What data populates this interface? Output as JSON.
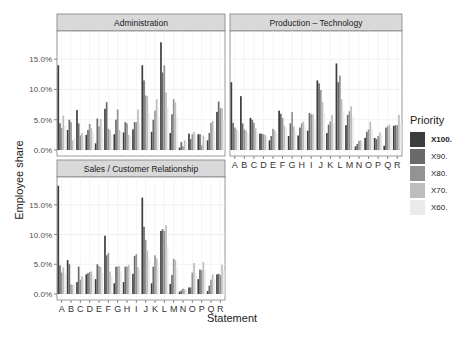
{
  "chart_data": {
    "type": "bar",
    "subtype": "grouped-faceted",
    "ylabel": "Employee share",
    "xlabel": "Statement",
    "ylim": [
      0,
      19
    ],
    "yticks": [
      "0.0%",
      "5.0%",
      "10.0%",
      "15.0%"
    ],
    "ytick_values": [
      0,
      5,
      10,
      15
    ],
    "grid": true,
    "legend_position": "right",
    "categories": [
      "A",
      "B",
      "C",
      "D",
      "E",
      "F",
      "G",
      "H",
      "I",
      "J",
      "K",
      "L",
      "M",
      "N",
      "O",
      "P",
      "Q",
      "R"
    ],
    "legend": {
      "title": "Priority",
      "entries": [
        "X100.",
        "X90.",
        "X80.",
        "X70.",
        "X60."
      ],
      "colors": [
        "#3d3d3d",
        "#6a6a6a",
        "#939393",
        "#bdbdbd",
        "#ebebeb"
      ]
    },
    "facets": [
      {
        "title": "Administration",
        "series": [
          {
            "name": "X100.",
            "values": [
              14.0,
              3.3,
              6.6,
              2.5,
              1.1,
              6.8,
              2.6,
              2.9,
              3.4,
              14.0,
              3.0,
              17.8,
              2.8,
              0.4,
              2.7,
              2.6,
              1.6,
              6.3
            ]
          },
          {
            "name": "X90.",
            "values": [
              4.4,
              5.0,
              4.4,
              3.3,
              5.2,
              7.9,
              5.0,
              4.6,
              4.6,
              11.5,
              5.0,
              12.8,
              5.9,
              1.3,
              1.8,
              2.6,
              2.8,
              8.0
            ]
          },
          {
            "name": "X80.",
            "values": [
              3.6,
              4.6,
              2.4,
              4.3,
              3.9,
              3.5,
              6.7,
              4.4,
              4.6,
              9.0,
              6.5,
              14.0,
              8.4,
              0.6,
              2.6,
              0.8,
              4.5,
              6.9
            ]
          },
          {
            "name": "X70.",
            "values": [
              5.7,
              1.6,
              2.8,
              3.6,
              5.1,
              3.3,
              3.3,
              2.5,
              6.7,
              8.9,
              8.4,
              9.5,
              7.9,
              1.6,
              3.0,
              2.4,
              4.8,
              6.9
            ]
          },
          {
            "name": "X60.",
            "values": [
              4.0,
              2.0,
              2.2,
              2.8,
              3.5,
              2.5,
              3.0,
              2.3,
              4.5,
              6.0,
              5.5,
              7.0,
              5.5,
              1.2,
              2.5,
              2.0,
              3.0,
              5.0
            ]
          }
        ]
      },
      {
        "title": "Production – Technology",
        "series": [
          {
            "name": "X100.",
            "values": [
              11.2,
              8.9,
              5.3,
              2.7,
              1.6,
              6.5,
              2.3,
              2.4,
              3.2,
              11.5,
              2.8,
              14.3,
              4.1,
              0.6,
              2.0,
              2.0,
              0.7,
              4.0
            ]
          },
          {
            "name": "X90.",
            "values": [
              4.5,
              4.4,
              5.0,
              2.7,
              2.3,
              6.0,
              4.4,
              3.7,
              6.1,
              11.0,
              4.2,
              11.2,
              5.8,
              1.0,
              3.0,
              1.8,
              3.7,
              4.1
            ]
          },
          {
            "name": "X80.",
            "values": [
              3.7,
              3.4,
              4.5,
              2.6,
              3.5,
              5.3,
              6.3,
              4.4,
              5.9,
              9.9,
              4.7,
              12.3,
              6.4,
              1.5,
              3.4,
              2.3,
              3.9,
              4.1
            ]
          },
          {
            "name": "X70.",
            "values": [
              3.4,
              3.2,
              3.6,
              2.5,
              3.2,
              4.0,
              3.9,
              4.7,
              5.9,
              7.9,
              5.8,
              8.4,
              7.2,
              1.6,
              4.7,
              2.9,
              4.2,
              5.8
            ]
          },
          {
            "name": "X60.",
            "values": [
              3.0,
              2.8,
              3.0,
              2.2,
              2.8,
              3.5,
              3.2,
              3.8,
              4.8,
              6.0,
              4.5,
              6.5,
              5.5,
              1.3,
              3.5,
              2.5,
              3.5,
              4.5
            ]
          }
        ]
      },
      {
        "title": "Sales / Customer Relationship",
        "series": [
          {
            "name": "X100.",
            "values": [
              18.2,
              5.7,
              2.0,
              3.3,
              2.5,
              9.8,
              1.8,
              2.0,
              3.4,
              16.2,
              1.8,
              10.6,
              1.7,
              0.4,
              1.1,
              2.5,
              0.5,
              3.3
            ]
          },
          {
            "name": "X90.",
            "values": [
              4.8,
              5.0,
              4.6,
              3.5,
              5.0,
              6.5,
              4.6,
              4.6,
              6.4,
              11.3,
              4.6,
              10.9,
              3.2,
              0.6,
              1.1,
              4.1,
              1.4,
              3.4
            ]
          },
          {
            "name": "X80.",
            "values": [
              3.6,
              1.6,
              2.4,
              3.7,
              4.7,
              6.9,
              4.6,
              4.6,
              6.7,
              9.1,
              6.5,
              10.6,
              5.9,
              0.9,
              3.6,
              4.0,
              2.4,
              3.2
            ]
          },
          {
            "name": "X70.",
            "values": [
              4.5,
              1.5,
              3.0,
              3.8,
              4.5,
              3.8,
              4.7,
              4.9,
              4.5,
              7.3,
              6.0,
              11.6,
              5.7,
              0.8,
              5.2,
              5.4,
              3.3,
              4.9
            ]
          },
          {
            "name": "X60.",
            "values": [
              3.5,
              1.8,
              2.5,
              3.2,
              3.5,
              3.0,
              3.8,
              4.0,
              4.0,
              6.0,
              4.5,
              8.0,
              4.5,
              0.7,
              3.5,
              4.0,
              2.5,
              4.0
            ]
          }
        ]
      }
    ]
  }
}
